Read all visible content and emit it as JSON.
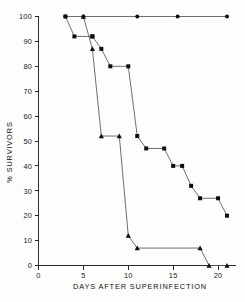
{
  "chart_data": {
    "type": "line",
    "title": "",
    "subtitle": "",
    "xlabel": "DAYS AFTER SUPERINFECTION",
    "ylabel": "% SURVIVORS",
    "xlim": [
      0,
      22
    ],
    "ylim": [
      0,
      100
    ],
    "xticks": [
      0,
      5,
      10,
      15,
      20
    ],
    "yticks": [
      0,
      10,
      20,
      30,
      40,
      50,
      60,
      70,
      80,
      90,
      100
    ],
    "xtick_labels": [
      "0",
      "5",
      "10",
      "15",
      "20"
    ],
    "ytick_labels": [
      "0",
      "10",
      "20",
      "30",
      "40",
      "50",
      "60",
      "70",
      "80",
      "90",
      "100"
    ],
    "grid": false,
    "legend": "none",
    "legend_position": "none",
    "step_style": "post",
    "series": [
      {
        "name": "control",
        "marker": "circle",
        "color": "#0d0d0d",
        "x": [
          3,
          5,
          11,
          15.5,
          21
        ],
        "y": [
          100,
          100,
          100,
          100,
          100
        ]
      },
      {
        "name": "group-squares",
        "marker": "square",
        "color": "#0d0d0d",
        "x": [
          3,
          4,
          6,
          6,
          7,
          8,
          10,
          11,
          12,
          14,
          15,
          16,
          17,
          18,
          20,
          21
        ],
        "y": [
          100,
          92,
          92,
          92,
          87,
          80,
          80,
          52,
          47,
          47,
          40,
          40,
          32,
          27,
          27,
          20
        ]
      },
      {
        "name": "group-triangles",
        "marker": "triangle",
        "color": "#0d0d0d",
        "x": [
          5,
          6,
          7,
          9,
          10,
          11,
          18,
          19,
          21
        ],
        "y": [
          100,
          87,
          52,
          52,
          12,
          7,
          7,
          0,
          0
        ]
      }
    ]
  },
  "axes": {
    "x_title": "DAYS AFTER SUPERINFECTION",
    "y_title": "% SURVIVORS"
  }
}
